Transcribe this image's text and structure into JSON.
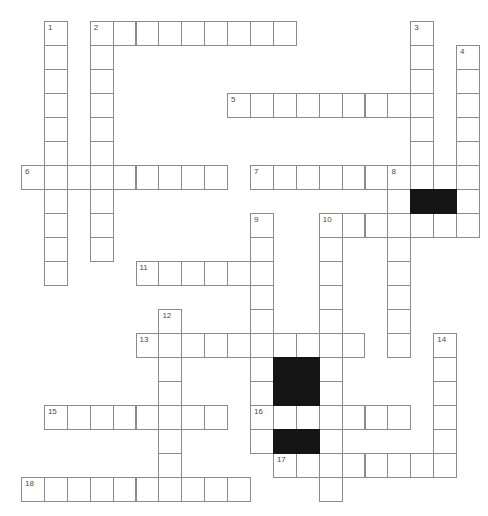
{
  "puzzle": {
    "rows": 20,
    "cols": 20,
    "entries": [
      {
        "number": "1",
        "direction": "down",
        "row": 0,
        "col": 1,
        "length": 11
      },
      {
        "number": "2",
        "direction": "across",
        "row": 0,
        "col": 3,
        "length": 9
      },
      {
        "number": "2",
        "direction": "down",
        "row": 0,
        "col": 3,
        "length": 10
      },
      {
        "number": "3",
        "direction": "down",
        "row": 0,
        "col": 17,
        "length": 7
      },
      {
        "number": "4",
        "direction": "down",
        "row": 1,
        "col": 19,
        "length": 8
      },
      {
        "number": "5",
        "direction": "across",
        "row": 3,
        "col": 9,
        "length": 9
      },
      {
        "number": "6",
        "direction": "across",
        "row": 6,
        "col": 0,
        "length": 9
      },
      {
        "number": "7",
        "direction": "across",
        "row": 6,
        "col": 10,
        "length": 10
      },
      {
        "number": "8",
        "direction": "down",
        "row": 6,
        "col": 16,
        "length": 8
      },
      {
        "number": "9",
        "direction": "down",
        "row": 8,
        "col": 10,
        "length": 10
      },
      {
        "number": "10",
        "direction": "across",
        "row": 8,
        "col": 13,
        "length": 7
      },
      {
        "number": "10",
        "direction": "down",
        "row": 8,
        "col": 13,
        "length": 12
      },
      {
        "number": "11",
        "direction": "across",
        "row": 10,
        "col": 5,
        "length": 6
      },
      {
        "number": "12",
        "direction": "down",
        "row": 12,
        "col": 6,
        "length": 8
      },
      {
        "number": "13",
        "direction": "across",
        "row": 13,
        "col": 5,
        "length": 10
      },
      {
        "number": "14",
        "direction": "down",
        "row": 13,
        "col": 18,
        "length": 6
      },
      {
        "number": "15",
        "direction": "across",
        "row": 16,
        "col": 1,
        "length": 8
      },
      {
        "number": "16",
        "direction": "across",
        "row": 16,
        "col": 10,
        "length": 7
      },
      {
        "number": "17",
        "direction": "across",
        "row": 18,
        "col": 11,
        "length": 8
      },
      {
        "number": "18",
        "direction": "across",
        "row": 19,
        "col": 0,
        "length": 10
      }
    ],
    "black_cells": [
      [
        7,
        17
      ],
      [
        7,
        18
      ],
      [
        14,
        11
      ],
      [
        14,
        12
      ],
      [
        15,
        11
      ],
      [
        15,
        12
      ],
      [
        17,
        11
      ],
      [
        17,
        12
      ]
    ],
    "numbers": [
      {
        "label": "1",
        "row": 0,
        "col": 1
      },
      {
        "label": "2",
        "row": 0,
        "col": 3
      },
      {
        "label": "3",
        "row": 0,
        "col": 17
      },
      {
        "label": "4",
        "row": 1,
        "col": 19
      },
      {
        "label": "5",
        "row": 3,
        "col": 9
      },
      {
        "label": "6",
        "row": 6,
        "col": 0
      },
      {
        "label": "7",
        "row": 6,
        "col": 10
      },
      {
        "label": "8",
        "row": 6,
        "col": 16
      },
      {
        "label": "9",
        "row": 8,
        "col": 10
      },
      {
        "label": "10",
        "row": 8,
        "col": 13
      },
      {
        "label": "11",
        "row": 10,
        "col": 5
      },
      {
        "label": "12",
        "row": 12,
        "col": 6
      },
      {
        "label": "13",
        "row": 13,
        "col": 5
      },
      {
        "label": "14",
        "row": 13,
        "col": 18
      },
      {
        "label": "15",
        "row": 16,
        "col": 1
      },
      {
        "label": "16",
        "row": 16,
        "col": 10
      },
      {
        "label": "17",
        "row": 18,
        "col": 11
      },
      {
        "label": "18",
        "row": 19,
        "col": 0
      }
    ]
  }
}
